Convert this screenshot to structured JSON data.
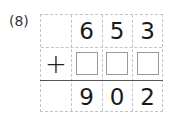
{
  "problem": {
    "label": "(8)",
    "operator": "+",
    "top_digits": [
      "",
      "6",
      "5",
      "3"
    ],
    "answer_digits": [
      "",
      "9",
      "0",
      "2"
    ],
    "blank_count": 3
  }
}
